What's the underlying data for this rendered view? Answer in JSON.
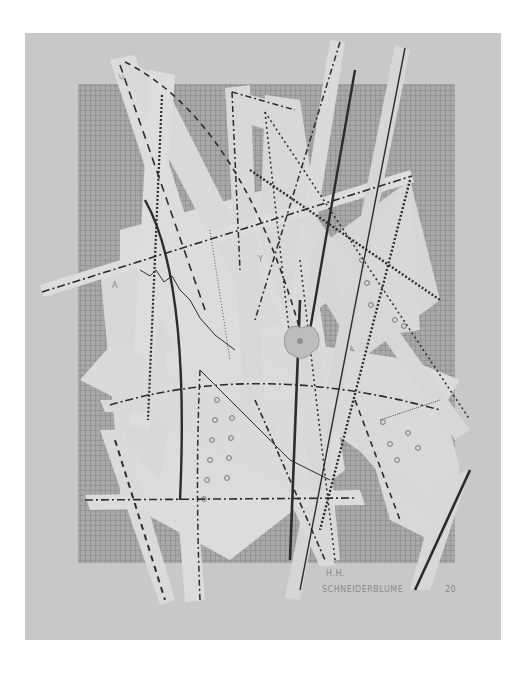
{
  "artwork": {
    "signature_initials": "H.H.",
    "title_inscription": "SCHNEIDERBLUME",
    "year_inscription": "20",
    "colors": {
      "page_background": "#ffffff",
      "paper": "#c9c9c9",
      "grid_fill": "#a9a9a9",
      "grid_line": "#7f7f7f",
      "strip": "#dedede",
      "ink": "#2a2a2a"
    },
    "paper_bounds": {
      "x": 25,
      "y": 33,
      "w": 476,
      "h": 607
    },
    "grid_bounds": {
      "x": 78,
      "y": 84,
      "w": 377,
      "h": 479
    }
  }
}
